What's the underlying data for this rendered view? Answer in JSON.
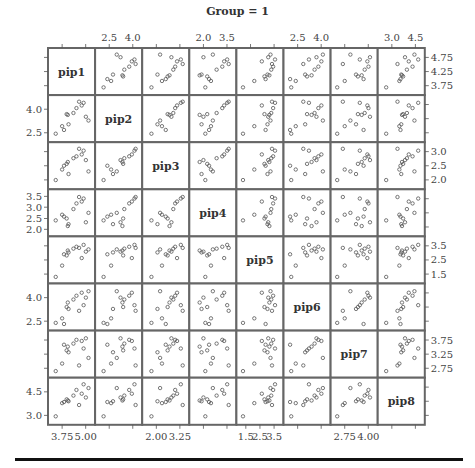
{
  "chart_data": {
    "type": "scatter-matrix",
    "title": "Group = 1",
    "variables": [
      "pip1",
      "pip2",
      "pip3",
      "pip4",
      "pip5",
      "pip6",
      "pip7",
      "pip8"
    ],
    "axis_ticks": {
      "pip1": {
        "labels": [
          "3.75",
          "5.00"
        ],
        "side_bottom": true,
        "right_labels": [
          "3.75",
          "4.25",
          "4.75"
        ]
      },
      "pip2": {
        "top_labels": [
          "2.5",
          "4.0"
        ],
        "left_labels": [
          "2.5",
          "4.0"
        ]
      },
      "pip3": {
        "bottom_labels": [
          "2.00",
          "3.25"
        ],
        "right_labels": [
          "2.0",
          "2.5",
          "3.0"
        ]
      },
      "pip4": {
        "top_labels": [
          "2.0",
          "3.5"
        ],
        "left_labels": [
          "2.0",
          "2.5",
          "3.0",
          "3.5"
        ]
      },
      "pip5": {
        "bottom_labels": [
          "1.5",
          "2.5",
          "3.5"
        ],
        "right_labels": [
          "1.5",
          "2.5",
          "3.5"
        ]
      },
      "pip6": {
        "top_labels": [
          "2.5",
          "4.0"
        ],
        "left_labels": [
          "2.5",
          "4.0"
        ]
      },
      "pip7": {
        "bottom_labels": [
          "2.75",
          "4.00"
        ],
        "right_labels": [
          "2.75",
          "3.25",
          "3.75"
        ]
      },
      "pip8": {
        "top_labels": [
          "3.0",
          "4.5"
        ],
        "left_labels": [
          "3.0",
          "4.5"
        ]
      }
    },
    "n_points": 13,
    "normalized_values": {
      "pip1": [
        0.08,
        0.25,
        0.42,
        0.37,
        0.4,
        0.55,
        0.63,
        0.77,
        0.82,
        0.88,
        0.95,
        0.7,
        0.3
      ],
      "pip2": [
        0.1,
        0.3,
        0.35,
        0.62,
        0.6,
        0.65,
        0.78,
        0.85,
        0.92,
        0.55,
        0.45,
        0.95,
        0.2
      ],
      "pip3": [
        0.12,
        0.4,
        0.28,
        0.55,
        0.6,
        0.7,
        0.75,
        0.8,
        0.9,
        0.65,
        0.35,
        0.95,
        0.5
      ],
      "pip4": [
        0.3,
        0.45,
        0.2,
        0.35,
        0.15,
        0.6,
        0.75,
        0.8,
        0.88,
        0.25,
        0.5,
        0.92,
        0.4
      ],
      "pip5": [
        0.05,
        0.35,
        0.7,
        0.62,
        0.75,
        0.8,
        0.85,
        0.55,
        0.9,
        0.72,
        0.78,
        0.82,
        0.65
      ],
      "pip6": [
        0.08,
        0.2,
        0.45,
        0.5,
        0.62,
        0.7,
        0.8,
        0.88,
        0.55,
        0.75,
        0.92,
        0.4,
        0.05
      ],
      "pip7": [
        0.05,
        0.25,
        0.55,
        0.6,
        0.7,
        0.78,
        0.88,
        0.85,
        0.65,
        0.92,
        0.4,
        0.2,
        0.75
      ],
      "pip8": [
        0.1,
        0.45,
        0.5,
        0.55,
        0.52,
        0.65,
        0.8,
        0.7,
        0.95,
        0.6,
        0.85,
        0.4,
        0.48
      ]
    }
  }
}
